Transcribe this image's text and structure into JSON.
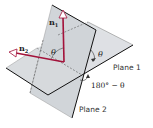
{
  "diagram": {
    "type": "dihedral-angle-between-planes",
    "labels": {
      "plane1": "Plane 1",
      "plane2": "Plane 2",
      "normal1": "n",
      "normal1_sub": "1",
      "normal2": "n",
      "normal2_sub": "2",
      "theta_between_normals": "θ",
      "theta_between_planes": "θ",
      "supplementary_angle": "180° − θ"
    },
    "colors": {
      "plane_fill": "#d9dcdf",
      "plane_edge": "#1a1a1a",
      "normal_vectors": "#a3123a",
      "dashed_lines": "#555555",
      "text": "#222222"
    }
  }
}
